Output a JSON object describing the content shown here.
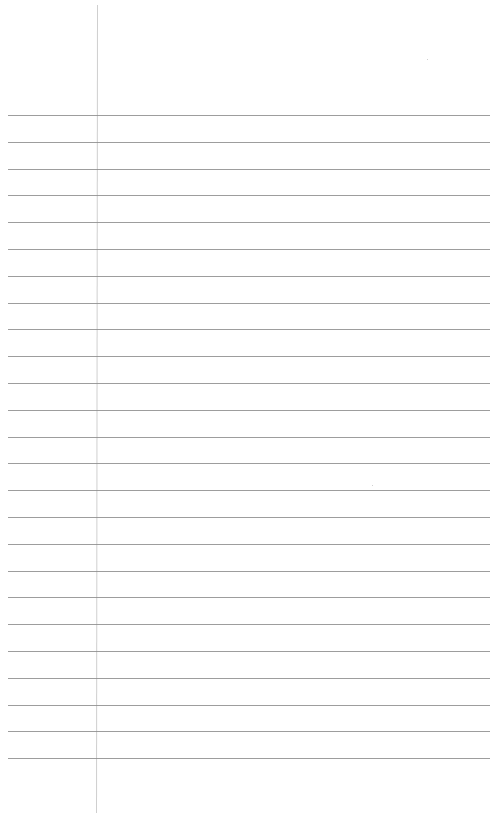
{
  "page": {
    "type": "lined-paper",
    "background": "#ffffff",
    "rule_color": "#8c8c8c",
    "margin_color": "#cfcfcf",
    "first_rule_y": 115,
    "rule_spacing": 26.8,
    "rule_count": 25,
    "rule_left": 8,
    "rule_right": 490,
    "margin_x": 97,
    "text_lines": []
  }
}
